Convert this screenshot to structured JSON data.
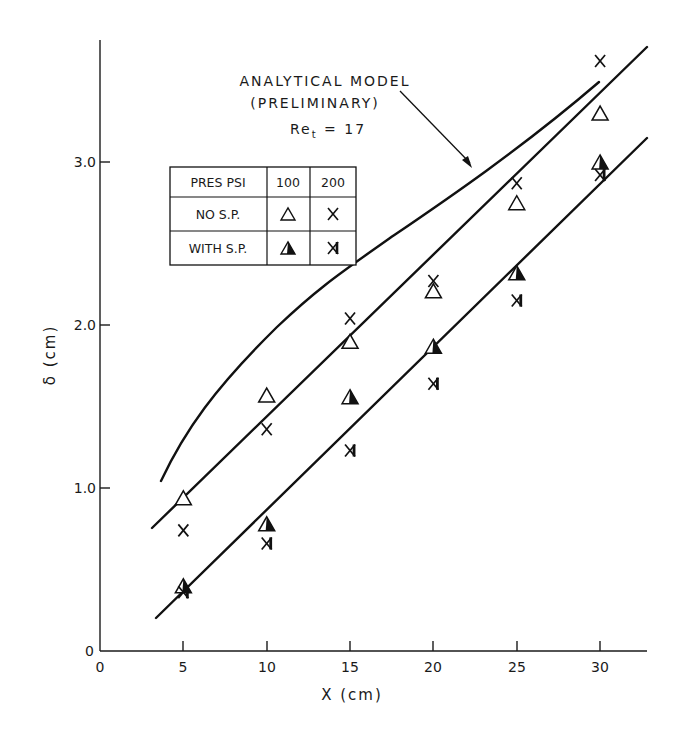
{
  "chart_data": {
    "type": "scatter",
    "title": "",
    "xlabel": "X (cm)",
    "ylabel": "δ (cm)",
    "xlim": [
      0,
      32.8
    ],
    "ylim": [
      0,
      3.8
    ],
    "grid": false,
    "x_ticks": [
      0,
      5,
      10,
      15,
      20,
      25,
      30
    ],
    "x_tick_labels": [
      "0",
      "5",
      "10",
      "15",
      "20",
      "25",
      "30"
    ],
    "y_ticks": [
      0,
      1.0,
      2.0,
      3.0
    ],
    "y_tick_labels": [
      "0",
      "1.0",
      "2.0",
      "3.0"
    ],
    "series": [
      {
        "name": "NO S.P., 100 PSI",
        "marker": "open-triangle",
        "x": [
          5,
          10,
          15,
          20,
          25,
          30
        ],
        "y": [
          0.94,
          1.57,
          1.9,
          2.21,
          2.75,
          3.3
        ]
      },
      {
        "name": "NO S.P., 200 PSI",
        "marker": "x",
        "x": [
          5,
          10,
          15,
          20,
          25,
          30
        ],
        "y": [
          0.74,
          1.36,
          2.04,
          2.27,
          2.87,
          3.62
        ]
      },
      {
        "name": "WITH S.P., 100 PSI",
        "marker": "half-filled-triangle",
        "x": [
          5,
          10,
          15,
          20,
          25,
          30
        ],
        "y": [
          0.4,
          0.78,
          1.56,
          1.87,
          2.32,
          3.0
        ]
      },
      {
        "name": "WITH S.P., 200 PSI",
        "marker": "x-bar",
        "x": [
          5,
          10,
          15,
          20,
          25,
          30
        ],
        "y": [
          0.36,
          0.66,
          1.23,
          1.64,
          2.15,
          2.92
        ]
      }
    ],
    "lines": [
      {
        "name": "Analytical model (preliminary) Re_t = 17",
        "kind": "curve",
        "x": [
          3.7,
          6.6,
          10.6,
          15.2,
          20.0,
          25.0,
          29.9
        ],
        "y": [
          1.04,
          1.57,
          1.99,
          2.36,
          2.76,
          3.14,
          3.49
        ]
      },
      {
        "name": "Fit line, no S.P.",
        "kind": "straight",
        "x": [
          3.1,
          32.8
        ],
        "y": [
          0.75,
          3.7
        ]
      },
      {
        "name": "Fit line, with S.P.",
        "kind": "straight",
        "x": [
          3.4,
          32.8
        ],
        "y": [
          0.2,
          3.15
        ]
      }
    ],
    "annotations": [
      {
        "text": "ANALYTICAL MODEL",
        "line": 1
      },
      {
        "text": "(PRELIMINARY)",
        "line": 2
      },
      {
        "text": "Re_t = 17",
        "line": 3
      }
    ],
    "legend": {
      "position": "upper-left (inside)",
      "header": [
        "PRES PSI",
        "100",
        "200"
      ],
      "rows": [
        {
          "label": "NO S.P.",
          "100": "open-triangle",
          "200": "x"
        },
        {
          "label": "WITH S.P.",
          "100": "half-filled-triangle",
          "200": "x-bar"
        }
      ]
    }
  },
  "text": {
    "xlabel": "X (cm)",
    "ylabel": "δ (cm)",
    "annot1": "ANALYTICAL MODEL",
    "annot2": "(PRELIMINARY)",
    "annot3_main": "Re",
    "annot3_sub": "t",
    "annot3_rest": " = 17",
    "legend_h0": "PRES PSI",
    "legend_h1": "100",
    "legend_h2": "200",
    "legend_r1": "NO S.P.",
    "legend_r2": "WITH S.P.",
    "x0": "0",
    "x5": "5",
    "x10": "10",
    "x15": "15",
    "x20": "20",
    "x25": "25",
    "x30": "30",
    "y0": "0",
    "y1": "1.0",
    "y2": "2.0",
    "y3": "3.0"
  }
}
